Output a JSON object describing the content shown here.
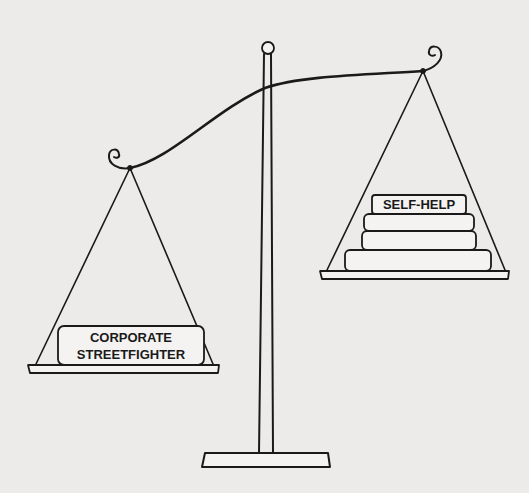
{
  "illustration": {
    "description": "Balance scale cartoon",
    "left_pan": {
      "books": [
        {
          "label_line1": "CORPORATE",
          "label_line2": "STREETFIGHTER"
        }
      ]
    },
    "right_pan": {
      "books": [
        {
          "label": "SELF-HELP"
        },
        {
          "label": ""
        },
        {
          "label": ""
        },
        {
          "label": ""
        }
      ]
    },
    "colors": {
      "background": "#ecebe9",
      "ink": "#1a1a1a",
      "book_fill": "#f4f3f1"
    }
  }
}
